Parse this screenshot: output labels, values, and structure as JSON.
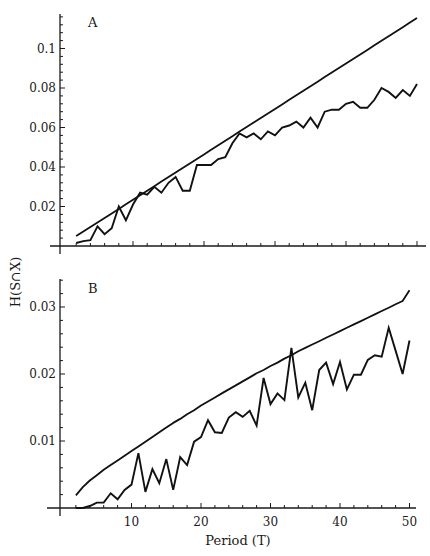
{
  "figure": {
    "xlabel": "Period (T)",
    "ylabel": "H(S∩X)",
    "line_color": "#111111",
    "background": "#ffffff"
  },
  "chart_data": [
    {
      "type": "line",
      "panel": "A",
      "title": "A",
      "xlabel": "Period (T)",
      "ylabel": "H(S∩X)",
      "xlim": [
        0,
        52
      ],
      "ylim": [
        0,
        0.118
      ],
      "x_ticks": [
        10,
        20,
        30,
        40,
        50
      ],
      "y_ticks": [
        0.02,
        0.04,
        0.06,
        0.08,
        0.1
      ],
      "y_tick_labels": [
        "0.02",
        "0.04",
        "0.06",
        "0.08",
        "0.1"
      ],
      "grid": false,
      "x_tick_labels_shown": false,
      "x": [
        2,
        3,
        4,
        5,
        6,
        7,
        8,
        9,
        10,
        11,
        12,
        13,
        14,
        15,
        16,
        17,
        18,
        19,
        20,
        21,
        22,
        23,
        24,
        25,
        26,
        27,
        28,
        29,
        30,
        31,
        32,
        33,
        34,
        35,
        36,
        37,
        38,
        39,
        40,
        41,
        42,
        43,
        44,
        45,
        46,
        47,
        48,
        49,
        50
      ],
      "series": [
        {
          "name": "upper bound",
          "style": "smooth",
          "values": [
            0.005,
            0.0073,
            0.0096,
            0.0119,
            0.0142,
            0.0165,
            0.0188,
            0.0211,
            0.0234,
            0.0257,
            0.028,
            0.0303,
            0.0326,
            0.0349,
            0.0372,
            0.0395,
            0.0418,
            0.0441,
            0.0464,
            0.0487,
            0.051,
            0.0533,
            0.0556,
            0.0579,
            0.0602,
            0.0625,
            0.0648,
            0.0671,
            0.0694,
            0.0717,
            0.074,
            0.0763,
            0.0786,
            0.0809,
            0.0832,
            0.0855,
            0.0878,
            0.0901,
            0.0924,
            0.0947,
            0.097,
            0.0993,
            0.1016,
            0.1039,
            0.1062,
            0.1085,
            0.1108,
            0.1131,
            0.1154
          ]
        },
        {
          "name": "observed",
          "style": "jagged",
          "values": [
            0.0015,
            0.0025,
            0.003,
            0.01,
            0.006,
            0.009,
            0.02,
            0.013,
            0.021,
            0.027,
            0.026,
            0.03,
            0.027,
            0.032,
            0.035,
            0.028,
            0.028,
            0.041,
            0.041,
            0.041,
            0.044,
            0.045,
            0.052,
            0.057,
            0.055,
            0.057,
            0.054,
            0.058,
            0.056,
            0.06,
            0.061,
            0.063,
            0.06,
            0.065,
            0.06,
            0.068,
            0.069,
            0.069,
            0.072,
            0.073,
            0.07,
            0.07,
            0.074,
            0.08,
            0.078,
            0.075,
            0.079,
            0.076,
            0.082
          ]
        }
      ]
    },
    {
      "type": "line",
      "panel": "B",
      "title": "B",
      "xlabel": "Period (T)",
      "ylabel": "H(S∩X)",
      "xlim": [
        0,
        52
      ],
      "ylim": [
        0,
        0.034
      ],
      "x_ticks": [
        10,
        20,
        30,
        40,
        50
      ],
      "x_tick_labels": [
        "10",
        "20",
        "30",
        "40",
        "50"
      ],
      "y_ticks": [
        0.01,
        0.02,
        0.03
      ],
      "y_tick_labels": [
        "0.01",
        "0.02",
        "0.03"
      ],
      "grid": false,
      "x": [
        2,
        3,
        4,
        5,
        6,
        7,
        8,
        9,
        10,
        11,
        12,
        13,
        14,
        15,
        16,
        17,
        18,
        19,
        20,
        21,
        22,
        23,
        24,
        25,
        26,
        27,
        28,
        29,
        30,
        31,
        32,
        33,
        34,
        35,
        36,
        37,
        38,
        39,
        40,
        41,
        42,
        43,
        44,
        45,
        46,
        47,
        48,
        49,
        50
      ],
      "series": [
        {
          "name": "upper bound",
          "style": "smooth-concave",
          "values": [
            0.0019,
            0.0031,
            0.0041,
            0.0049,
            0.0057,
            0.0064,
            0.0071,
            0.0078,
            0.0085,
            0.0092,
            0.0099,
            0.0106,
            0.0113,
            0.012,
            0.0127,
            0.0133,
            0.014,
            0.0146,
            0.0153,
            0.0159,
            0.0165,
            0.0171,
            0.0177,
            0.0183,
            0.0189,
            0.0195,
            0.0201,
            0.0206,
            0.0212,
            0.0217,
            0.0223,
            0.0228,
            0.0234,
            0.0239,
            0.0244,
            0.0249,
            0.0254,
            0.0259,
            0.0264,
            0.0269,
            0.0274,
            0.0279,
            0.0284,
            0.0289,
            0.0294,
            0.0299,
            0.0304,
            0.0309,
            0.0325
          ]
        },
        {
          "name": "observed",
          "style": "jagged",
          "values": [
            0.0,
            0.0,
            0.0003,
            0.0008,
            0.0008,
            0.0022,
            0.0013,
            0.0027,
            0.0035,
            0.0082,
            0.0024,
            0.0058,
            0.0037,
            0.0073,
            0.0027,
            0.0076,
            0.0064,
            0.0099,
            0.0106,
            0.0131,
            0.0113,
            0.0112,
            0.0135,
            0.0143,
            0.0136,
            0.0145,
            0.0123,
            0.0194,
            0.0155,
            0.0171,
            0.0161,
            0.0239,
            0.0165,
            0.0187,
            0.0146,
            0.0206,
            0.0217,
            0.0185,
            0.0218,
            0.0177,
            0.0199,
            0.0199,
            0.0221,
            0.0228,
            0.0226,
            0.0269,
            0.0235,
            0.02,
            0.025
          ]
        }
      ]
    }
  ]
}
